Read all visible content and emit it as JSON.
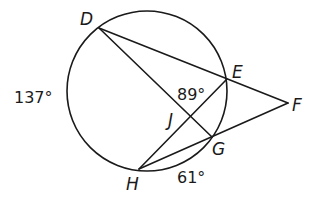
{
  "diagram": {
    "type": "circle-secants-chords",
    "circle": {
      "cx": 147,
      "cy": 91,
      "r": 80
    },
    "points": {
      "D": {
        "x": 99,
        "y": 28,
        "label": "D"
      },
      "E": {
        "x": 227,
        "y": 79,
        "label": "E"
      },
      "F": {
        "x": 288,
        "y": 103,
        "label": "F"
      },
      "G": {
        "x": 212,
        "y": 137,
        "label": "G"
      },
      "H": {
        "x": 139,
        "y": 169,
        "label": "H"
      },
      "J": {
        "x": 191,
        "y": 114,
        "label": "J"
      }
    },
    "segments": [
      {
        "from": "D",
        "to": "F"
      },
      {
        "from": "D",
        "to": "G"
      },
      {
        "from": "H",
        "to": "E"
      },
      {
        "from": "H",
        "to": "F"
      }
    ],
    "angle_labels": {
      "arc_DH": "137°",
      "arc_HG": "61°",
      "angle_EJ": "89°"
    }
  }
}
